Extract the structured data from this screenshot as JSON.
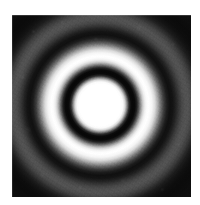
{
  "figure": {
    "kind": "diffraction-ring-pattern",
    "caption": "",
    "background_color": "#ffffff",
    "plate": {
      "x": 12,
      "y": 15,
      "width": 179,
      "height": 182,
      "background_color": "#070707"
    },
    "pattern": {
      "center_x": 100,
      "center_y": 105,
      "description": "Concentric circular interference fringes (Airy-type) on a dark field",
      "core_label": "central bright disk",
      "ring1_label": "first dark ring",
      "ring2_label": "first bright ring",
      "ring3_label": "second dark ring",
      "ring4_label": "second bright ring",
      "outer_label": "dark outer field"
    },
    "rings": [
      {
        "name": "central bright disk",
        "inner_radius": 0,
        "outer_radius": 25,
        "tone": "white",
        "color": "#ffffff"
      },
      {
        "name": "first dark ring",
        "inner_radius": 26,
        "outer_radius": 35,
        "tone": "black",
        "color": "#070707"
      },
      {
        "name": "first bright ring",
        "inner_radius": 37,
        "outer_radius": 52,
        "tone": "white",
        "color": "#ffffff"
      },
      {
        "name": "second dark ring",
        "inner_radius": 56,
        "outer_radius": 68,
        "tone": "black",
        "color": "#101010"
      },
      {
        "name": "second bright ring",
        "inner_radius": 70,
        "outer_radius": 82,
        "tone": "mid-gray",
        "color": "#5d5d5d"
      },
      {
        "name": "dark outer field",
        "inner_radius": 90,
        "outer_radius": 130,
        "tone": "near-black",
        "color": "#0b0b0b"
      }
    ],
    "noise": {
      "label": "film grain",
      "present": true
    }
  }
}
